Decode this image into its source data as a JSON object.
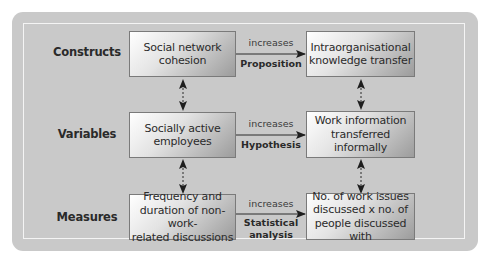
{
  "diagram": {
    "rows": [
      {
        "label": "Constructs",
        "left_box": "Social network\ncohesion",
        "relation": "increases",
        "relation_type": "Proposition",
        "right_box": "Intraorganisational\nknowledge transfer"
      },
      {
        "label": "Variables",
        "left_box": "Socially active\nemployees",
        "relation": "increases",
        "relation_type": "Hypothesis",
        "right_box": "Work information\ntransferred informally"
      },
      {
        "label": "Measures",
        "left_box": "Frequency and\nduration of non-work-\nrelated discussions",
        "relation": "increases",
        "relation_type": "Statistical\nanalysis",
        "right_box": "No. of work issues\ndiscussed x no. of\npeople discussed with"
      }
    ],
    "icons": {
      "horizontal_arrow": "arrow-right-icon",
      "vertical_link": "dashed-double-arrow-icon"
    },
    "colors": {
      "frame": "#c9c9c9",
      "inner_border": "#f4f4f4",
      "box_border": "#7a7a7a",
      "text": "#2b2b2b"
    }
  }
}
